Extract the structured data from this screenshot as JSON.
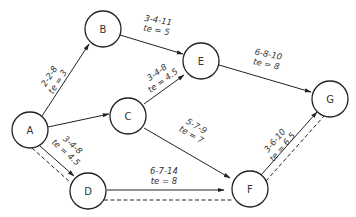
{
  "diagram": {
    "nodes": [
      {
        "id": "A",
        "label": "A",
        "x": 30,
        "y": 130
      },
      {
        "id": "B",
        "label": "B",
        "x": 103,
        "y": 29
      },
      {
        "id": "C",
        "label": "C",
        "x": 128,
        "y": 116
      },
      {
        "id": "D",
        "label": "D",
        "x": 88,
        "y": 191
      },
      {
        "id": "E",
        "label": "E",
        "x": 201,
        "y": 61
      },
      {
        "id": "F",
        "label": "F",
        "x": 250,
        "y": 189
      },
      {
        "id": "G",
        "label": "G",
        "x": 330,
        "y": 99
      }
    ],
    "edges": [
      {
        "from": "A",
        "to": "B",
        "estimate": "2-2-8",
        "te": "te = 3"
      },
      {
        "from": "A",
        "to": "C",
        "estimate": "",
        "te": ""
      },
      {
        "from": "A",
        "to": "D",
        "estimate": "3-4-8",
        "te": "te = 4.5"
      },
      {
        "from": "B",
        "to": "E",
        "estimate": "3-4-11",
        "te": "te = 5"
      },
      {
        "from": "C",
        "to": "E",
        "estimate": "3-4-8",
        "te": "te = 4.5"
      },
      {
        "from": "C",
        "to": "F",
        "estimate": "5-7-9",
        "te": "te = 7"
      },
      {
        "from": "D",
        "to": "F",
        "estimate": "6-7-14",
        "te": "te = 8"
      },
      {
        "from": "E",
        "to": "G",
        "estimate": "6-8-10",
        "te": "te = 8"
      },
      {
        "from": "F",
        "to": "G",
        "estimate": "3-6-10",
        "te": "te = 6.5"
      }
    ],
    "critical_path": [
      "A",
      "D",
      "F",
      "G"
    ],
    "colors": {
      "stroke": "#222222",
      "text": "#333333",
      "background": "#ffffff"
    }
  }
}
